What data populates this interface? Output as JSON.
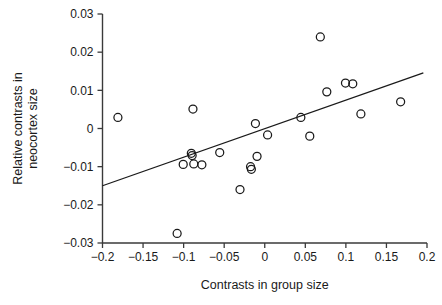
{
  "chart_data": {
    "type": "scatter",
    "title": "",
    "subtitle": "",
    "xlabel": "Contrasts in group size",
    "ylabel_line1": "Relative contrasts in",
    "ylabel_line2": "neocortex size",
    "xlim": [
      -0.2,
      0.2
    ],
    "ylim": [
      -0.03,
      0.03
    ],
    "xticks": [
      -0.2,
      -0.15,
      -0.1,
      -0.05,
      0,
      0.05,
      0.1,
      0.15,
      0.2
    ],
    "yticks": [
      0.03,
      0.02,
      0.01,
      0,
      -0.01,
      -0.02,
      -0.03
    ],
    "xtick_labels": [
      "−0.2",
      "−0.15",
      "−0.1",
      "−0.05",
      "0",
      "0.05",
      "0.1",
      "0.15",
      "0.2"
    ],
    "ytick_labels": [
      "0.03",
      "0.02",
      "0.01",
      "0",
      "−0.01",
      "−0.02",
      "−0.03"
    ],
    "grid": false,
    "legend": null,
    "marker_style": "open-circle",
    "marker_radius_px": 4,
    "series": [
      {
        "name": "Primate genera",
        "points": [
          {
            "x": -0.181,
            "y": 0.0029
          },
          {
            "x": -0.108,
            "y": -0.0275
          },
          {
            "x": -0.1005,
            "y": -0.0094
          },
          {
            "x": -0.0905,
            "y": -0.0065
          },
          {
            "x": -0.0895,
            "y": -0.0071
          },
          {
            "x": -0.0885,
            "y": 0.0051
          },
          {
            "x": -0.0875,
            "y": -0.0093
          },
          {
            "x": -0.0775,
            "y": -0.0095
          },
          {
            "x": -0.0555,
            "y": -0.0063
          },
          {
            "x": -0.0305,
            "y": -0.016
          },
          {
            "x": -0.0175,
            "y": -0.01
          },
          {
            "x": -0.0165,
            "y": -0.0107
          },
          {
            "x": -0.0115,
            "y": 0.0013
          },
          {
            "x": -0.0095,
            "y": -0.0073
          },
          {
            "x": 0.0035,
            "y": -0.0017
          },
          {
            "x": 0.0445,
            "y": 0.0029
          },
          {
            "x": 0.0555,
            "y": -0.002
          },
          {
            "x": 0.0685,
            "y": 0.024
          },
          {
            "x": 0.0765,
            "y": 0.0096
          },
          {
            "x": 0.0995,
            "y": 0.0119
          },
          {
            "x": 0.1085,
            "y": 0.0117
          },
          {
            "x": 0.1185,
            "y": 0.0038
          },
          {
            "x": 0.1675,
            "y": 0.007
          }
        ]
      }
    ],
    "fit_line": {
      "name": "Least-squares regression line",
      "x_start": -0.2,
      "y_start": -0.015,
      "x_end": 0.1955,
      "y_end": 0.0146
    }
  }
}
